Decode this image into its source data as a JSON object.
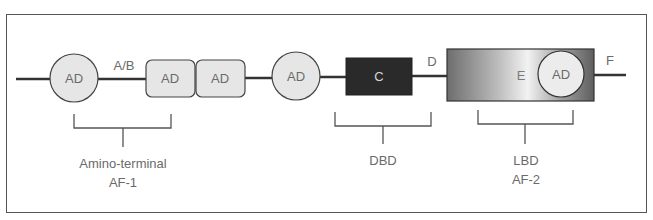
{
  "diagram": {
    "domains": {
      "ab": "A/B",
      "c": "C",
      "d": "D",
      "e": "E",
      "f": "F"
    },
    "activation_domains": {
      "ad1": "AD",
      "ad2": "AD",
      "ad3": "AD",
      "ad4": "AD",
      "ad5": "AD"
    },
    "brackets": {
      "af1": {
        "line1": "Amino-terminal",
        "line2": "AF-1"
      },
      "dbd": {
        "line1": "DBD"
      },
      "lbd": {
        "line1": "LBD",
        "line2": "AF-2"
      }
    },
    "colors": {
      "ad_fill": "#e6e6e6",
      "c_box": "#2a2a2a",
      "e_box_dark": "#6d6d6d",
      "e_box_light": "#ececec",
      "line": "#333333",
      "text": "#6a6a6a"
    }
  }
}
